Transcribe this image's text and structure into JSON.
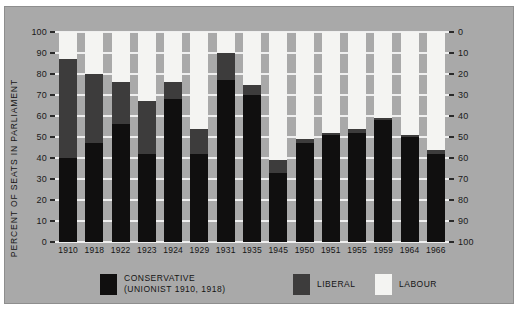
{
  "chart_data": {
    "type": "bar",
    "subtype": "stacked-100-percent",
    "title": "",
    "xlabel": "",
    "ylabel": "PERCENT OF SEATS IN PARLIAMENT",
    "ylim": [
      0,
      100
    ],
    "y_ticks_left": [
      0,
      10,
      20,
      30,
      40,
      50,
      60,
      70,
      80,
      90,
      100
    ],
    "y_ticks_right": [
      0,
      10,
      20,
      30,
      40,
      50,
      60,
      70,
      80,
      90,
      100
    ],
    "right_axis_inverted": true,
    "grid": true,
    "legend_position": "bottom",
    "categories": [
      "1910",
      "1918",
      "1922",
      "1923",
      "1924",
      "1929",
      "1931",
      "1935",
      "1945",
      "1950",
      "1951",
      "1955",
      "1959",
      "1964",
      "1966"
    ],
    "series": [
      {
        "name": "CONSERVATIVE",
        "color": "#100f0f",
        "values": [
          40,
          47,
          56,
          42,
          68,
          42,
          77,
          70,
          33,
          47,
          51,
          52,
          58,
          50,
          42
        ]
      },
      {
        "name": "LIBERAL",
        "color": "#3d3c3c",
        "values": [
          47,
          33,
          20,
          25,
          8,
          12,
          13,
          5,
          6,
          2,
          1,
          2,
          1,
          1,
          2
        ]
      },
      {
        "name": "LABOUR",
        "color": "#f4f4f2",
        "values": [
          13,
          20,
          24,
          33,
          24,
          46,
          10,
          25,
          61,
          51,
          48,
          46,
          41,
          49,
          56
        ]
      }
    ],
    "stack_tops": {
      "conservative": [
        40,
        47,
        56,
        42,
        68,
        42,
        77,
        70,
        33,
        47,
        51,
        52,
        58,
        50,
        42
      ],
      "liberal": [
        87,
        80,
        76,
        67,
        76,
        54,
        90,
        75,
        39,
        49,
        52,
        54,
        59,
        51,
        44
      ]
    }
  },
  "legend": {
    "items": [
      {
        "label": "CONSERVATIVE",
        "sublabel": "(UNIONIST  1910, 1918)",
        "color": "#100f0f"
      },
      {
        "label": "LIBERAL",
        "sublabel": "",
        "color": "#3d3c3c"
      },
      {
        "label": "LABOUR",
        "sublabel": "",
        "color": "#f4f4f2"
      }
    ]
  },
  "colors": {
    "background": "#a9a9a9",
    "grid": "#efefef",
    "text": "#141414",
    "conservative": "#100f0f",
    "liberal": "#3d3c3c",
    "labour": "#f4f4f2"
  }
}
